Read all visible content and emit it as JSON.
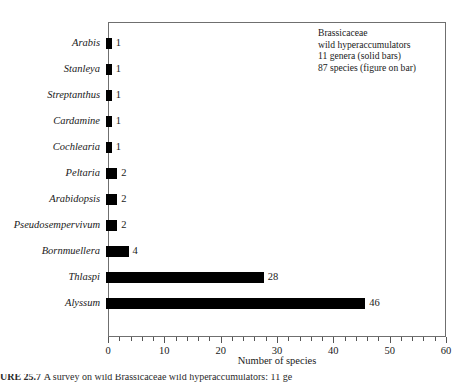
{
  "chart_data": {
    "type": "bar",
    "orientation": "horizontal",
    "title": "",
    "xlabel": "Number of species",
    "ylabel": "",
    "xlim": [
      0,
      60
    ],
    "xticks": [
      0,
      10,
      20,
      30,
      40,
      50,
      60
    ],
    "xtick_labels": [
      "0",
      "10",
      "20",
      "30",
      "40",
      "50",
      "60"
    ],
    "minor_tick_step": 2,
    "grid": false,
    "legend": "none",
    "bar_color": "#000000",
    "categories": [
      "Arabis",
      "Stanleya",
      "Streptanthus",
      "Cardamine",
      "Cochlearia",
      "Peltaria",
      "Arabidopsis",
      "Pseudosempervivum",
      "Bornmuellera",
      "Thlaspi",
      "Alyssum"
    ],
    "values": [
      1,
      1,
      1,
      1,
      1,
      2,
      2,
      2,
      4,
      28,
      46
    ],
    "data_labels": [
      "1",
      "1",
      "1",
      "1",
      "1",
      "2",
      "2",
      "2",
      "4",
      "28",
      "46"
    ],
    "annotations": [
      "Brassicaceae",
      "wild hyperaccumulators",
      "11 genera (solid bars)",
      "87 species (figure on bar)"
    ]
  },
  "caption": {
    "prefix": "URE 25.7",
    "text": "A survey on wild Brassicaceae wild hyperaccumulators: 11 ge"
  }
}
